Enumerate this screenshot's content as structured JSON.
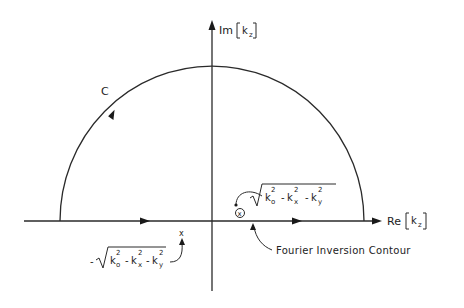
{
  "axes": {
    "vertical_label": {
      "prefix": "Im",
      "var": "k",
      "sub": "z"
    },
    "horizontal_label": {
      "prefix": "Re",
      "var": "k",
      "sub": "z"
    }
  },
  "contour": {
    "label": "C",
    "inversion_label": "Fourier Inversion Contour"
  },
  "poles": {
    "upper": {
      "marker": "x",
      "expr": {
        "k0": "k",
        "k0_sub": "o",
        "kx": "k",
        "kx_sub": "x",
        "ky": "k",
        "ky_sub": "y",
        "sup": "2",
        "minus": "-"
      }
    },
    "lower": {
      "marker": "x",
      "sign": "-",
      "expr": {
        "k0": "k",
        "k0_sub": "o",
        "kx": "k",
        "kx_sub": "x",
        "ky": "k",
        "ky_sub": "y",
        "sup": "2",
        "minus": "-"
      }
    }
  },
  "colors": {
    "ink": "#2a2a2a",
    "background": "#ffffff"
  }
}
